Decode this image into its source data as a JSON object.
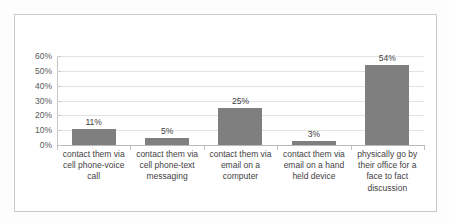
{
  "chart_data": {
    "type": "bar",
    "title": "",
    "subtitle": "",
    "xlabel": "",
    "ylabel": "",
    "ylim": [
      0,
      60
    ],
    "grid": true,
    "legend": "none",
    "orientation": "vertical",
    "bar_color": "#7f7f7f",
    "value_label_suffix": "%",
    "categories": [
      "contact them via cell phone-voice call",
      "contact them via cell phone-text messaging",
      "contact them via email on a computer",
      "contact them via email on a hand held device",
      "physically go by their office for a face to fact discussion"
    ],
    "category_lines": [
      [
        "contact them via",
        "cell phone-voice",
        "call"
      ],
      [
        "contact them via",
        "cell phone-text",
        "messaging"
      ],
      [
        "contact them via",
        "email on a",
        "computer"
      ],
      [
        "contact them via",
        "email on a hand",
        "held device"
      ],
      [
        "physically go by",
        "their office for a",
        "face to fact",
        "discussion"
      ]
    ],
    "values": [
      11,
      5,
      25,
      3,
      54
    ],
    "value_labels": [
      "11%",
      "5%",
      "25%",
      "3%",
      "54%"
    ],
    "yticks": [
      0,
      10,
      20,
      30,
      40,
      50,
      60
    ],
    "ytick_labels": [
      "0%",
      "10%",
      "20%",
      "30%",
      "40%",
      "50%",
      "60%"
    ]
  },
  "colors": {
    "bar": "#7f7f7f",
    "gridline": "#e3e3e3",
    "axis": "#bdbdbd",
    "frame": "#c9c9c9",
    "text": "#3f3f3f",
    "background": "#ffffff"
  }
}
